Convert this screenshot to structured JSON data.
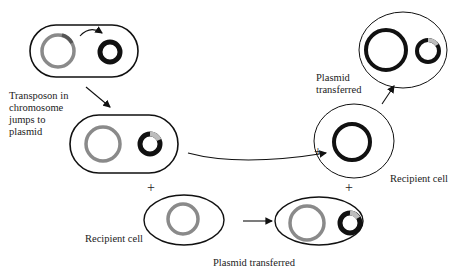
{
  "labels": {
    "transposon_jump": "Transposon in\nchromosome\njumps to\nplasmid",
    "plasmid_transferred_top": "Plasmid\ntransferred",
    "recipient_cell_right": "Recipient cell",
    "recipient_cell_bottom": "Recipient cell",
    "plasmid_transferred_bottom": "Plasmid transferred"
  },
  "symbols": {
    "plus": "+"
  },
  "colors": {
    "cell_outline": "#111111",
    "chromosome_gray": "#8a8a8a",
    "plasmid_black": "#111111",
    "transposon_segment": "#9a9a9a",
    "text": "#222222"
  }
}
